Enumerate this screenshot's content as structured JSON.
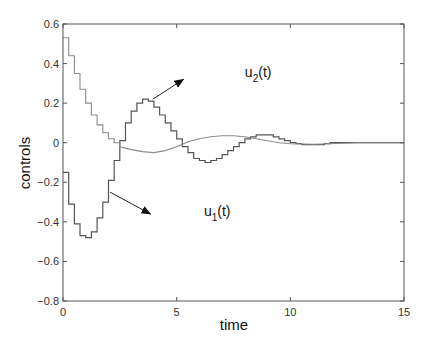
{
  "chart_data": {
    "type": "line",
    "title": "",
    "xlabel": "time",
    "ylabel": "controls",
    "xlim": [
      0,
      15
    ],
    "ylim": [
      -0.8,
      0.6
    ],
    "xticks": [
      0,
      5,
      10,
      15
    ],
    "xtick_labels": [
      "0",
      "5",
      "10",
      "15"
    ],
    "yticks": [
      0.6,
      0.4,
      0.2,
      0,
      -0.2,
      -0.4,
      -0.6,
      -0.8
    ],
    "ytick_labels": [
      "0.6",
      "0.4",
      "0.2",
      "0",
      "−0.2",
      "−0.4",
      "−0.6",
      "−0.8"
    ],
    "grid": false,
    "legend": "none (inline annotations with arrows)",
    "step_dt": 0.25,
    "series": [
      {
        "name": "step control (annotated u1(t) and u2(t))",
        "style": "step",
        "color": "#555555",
        "values": [
          -0.15,
          -0.31,
          -0.41,
          -0.47,
          -0.48,
          -0.45,
          -0.38,
          -0.3,
          -0.19,
          -0.09,
          0.01,
          0.1,
          0.16,
          0.2,
          0.22,
          0.21,
          0.18,
          0.14,
          0.1,
          0.06,
          0.02,
          -0.02,
          -0.05,
          -0.08,
          -0.09,
          -0.1,
          -0.09,
          -0.08,
          -0.06,
          -0.04,
          -0.02,
          0.0,
          0.02,
          0.03,
          0.04,
          0.04,
          0.04,
          0.03,
          0.02,
          0.01,
          0.0,
          -0.005,
          -0.01,
          -0.01,
          -0.01,
          -0.01,
          -0.005,
          0.0,
          0.0,
          0.0,
          0.0,
          0.0,
          0.0,
          0.0,
          0.0,
          0.0,
          0.0,
          0.0,
          0.0,
          0.0
        ]
      },
      {
        "name": "decaying control",
        "style": "step-then-smooth",
        "color": "#8a8a8a",
        "step_values": [
          0.53,
          0.44,
          0.35,
          0.27,
          0.2,
          0.14,
          0.09,
          0.05,
          0.02,
          0.0
        ],
        "smooth_points": [
          [
            2.5,
            -0.02
          ],
          [
            3.0,
            -0.035
          ],
          [
            3.5,
            -0.045
          ],
          [
            4.0,
            -0.05
          ],
          [
            4.5,
            -0.04
          ],
          [
            5.0,
            -0.02
          ],
          [
            5.5,
            0.005
          ],
          [
            6.0,
            0.02
          ],
          [
            6.5,
            0.03
          ],
          [
            7.0,
            0.035
          ],
          [
            7.5,
            0.035
          ],
          [
            8.0,
            0.03
          ],
          [
            8.5,
            0.02
          ],
          [
            9.0,
            0.01
          ],
          [
            9.5,
            0.0
          ],
          [
            10.0,
            -0.005
          ],
          [
            11.0,
            -0.008
          ],
          [
            12.0,
            -0.004
          ],
          [
            13.0,
            0.0
          ],
          [
            15.0,
            0.0
          ]
        ]
      }
    ],
    "annotations": [
      {
        "text": "u",
        "subscript": "2",
        "suffix": "(t)",
        "label": "u2(t)",
        "text_xy": [
          8.0,
          0.33
        ],
        "arrow_from": [
          3.95,
          0.22
        ],
        "arrow_to": [
          5.3,
          0.32
        ]
      },
      {
        "text": "u",
        "subscript": "1",
        "suffix": "(t)",
        "label": "u1(t)",
        "text_xy": [
          6.2,
          -0.37
        ],
        "arrow_from": [
          2.07,
          -0.25
        ],
        "arrow_to": [
          3.85,
          -0.36
        ]
      }
    ]
  }
}
